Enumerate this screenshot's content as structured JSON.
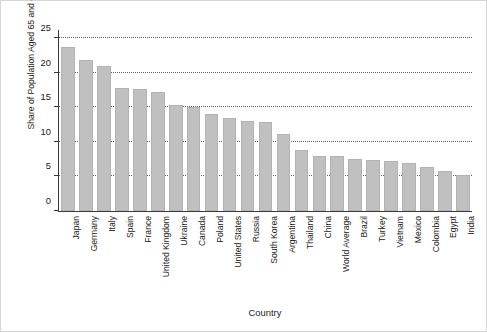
{
  "chart_data": {
    "type": "bar",
    "title": "",
    "xlabel": "Country",
    "ylabel": "Share of Population Aged 65 and Older (%)",
    "ylim": [
      0,
      26.2
    ],
    "yticks": [
      0,
      5,
      10,
      15,
      20,
      25
    ],
    "ytick_labels": [
      "0",
      "5",
      "10",
      "15",
      "20",
      "25"
    ],
    "grid": "horizontal-dotted",
    "legend": "none",
    "bar_color": "#c0c0c0",
    "categories": [
      "Japan",
      "Germany",
      "Italy",
      "Spain",
      "France",
      "United Kingdom",
      "Ukraine",
      "Canada",
      "Poland",
      "United States",
      "Russia",
      "South Korea",
      "Argentina",
      "Thailand",
      "China",
      "World Average",
      "Brazil",
      "Turkey",
      "Vietnam",
      "Mexico",
      "Colombia",
      "Egypt",
      "India"
    ],
    "values": [
      23.7,
      21.9,
      21.0,
      17.8,
      17.7,
      17.3,
      15.4,
      15.0,
      14.1,
      13.4,
      13.1,
      12.9,
      11.2,
      8.9,
      8.0,
      7.9,
      7.6,
      7.4,
      7.2,
      6.9,
      6.4,
      5.8,
      5.2
    ]
  },
  "axes": {
    "ylabel": "Share of Population Aged 65 and Older (%)",
    "xlabel": "Country"
  }
}
